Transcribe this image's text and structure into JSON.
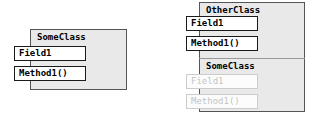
{
  "diagram": {
    "type": "uml-class-diagram",
    "colors": {
      "box_fill": "#e9e9e9",
      "box_border": "#555555",
      "member_fill": "#ffffff",
      "member_border": "#1a1a1a",
      "ghost_text": "#c4c4c4",
      "ghost_border": "#cccccc",
      "divider": "#9a9a9a",
      "page_background": "#ffffff"
    }
  },
  "left_class": {
    "title": "SomeClass",
    "members": [
      {
        "label": "Field1",
        "kind": "field",
        "state": "normal"
      },
      {
        "label": "Method1()",
        "kind": "method",
        "state": "normal"
      }
    ]
  },
  "right_class": {
    "title": "OtherClass",
    "members": [
      {
        "label": "Field1",
        "kind": "field",
        "state": "normal"
      },
      {
        "label": "Method1()",
        "kind": "method",
        "state": "normal"
      }
    ],
    "inherited_section": {
      "title": "SomeClass",
      "members": [
        {
          "label": "Field1",
          "kind": "field",
          "state": "inherited-disabled"
        },
        {
          "label": "Method1()",
          "kind": "method",
          "state": "inherited-disabled"
        }
      ]
    }
  }
}
